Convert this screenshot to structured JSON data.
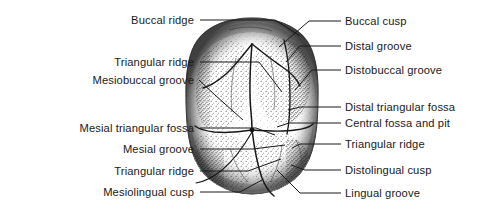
{
  "figure": {
    "kind": "anatomical-line-drawing",
    "view": "occlusal",
    "background_color": "#ffffff",
    "ink_color": "#1a1a1a"
  },
  "labels_left": [
    {
      "text": "Buccal ridge",
      "label_x": 194,
      "label_y": 24,
      "leader": "M200,20 L275,20 L300,36"
    },
    {
      "text": "Triangular ridge",
      "label_x": 194,
      "label_y": 66,
      "leader": "M200,62 L259,62 L282,92"
    },
    {
      "text": "Mesiobuccal groove",
      "label_x": 194,
      "label_y": 84,
      "leader": "M199,80 L215,95 L243,120"
    },
    {
      "text": "Mesial triangular fossa",
      "label_x": 194,
      "label_y": 132,
      "leader": "M200,128 L256,128 L275,135"
    },
    {
      "text": "Mesial groove",
      "label_x": 194,
      "label_y": 153,
      "leader": "M200,149 L253,149 L285,145"
    },
    {
      "text": "Triangular ridge",
      "label_x": 194,
      "label_y": 175,
      "leader": "M200,171 L248,171 L281,159"
    },
    {
      "text": "Mesiolingual cusp",
      "label_x": 194,
      "label_y": 196,
      "leader": "M200,192 L240,192 L262,180"
    }
  ],
  "labels_right": [
    {
      "text": "Buccal cusp",
      "label_x": 345,
      "label_y": 25,
      "leader": "M341,21 L309,21 L279,47"
    },
    {
      "text": "Distal groove",
      "label_x": 345,
      "label_y": 50,
      "leader": "M341,46 L300,46 L286,62"
    },
    {
      "text": "Distobuccal groove",
      "label_x": 345,
      "label_y": 74,
      "leader": "M341,70 L312,70 L295,90"
    },
    {
      "text": "Distal triangular fossa",
      "label_x": 345,
      "label_y": 111,
      "leader": "M341,107 L300,107 L288,110"
    },
    {
      "text": "Central fossa and pit",
      "label_x": 345,
      "label_y": 127,
      "leader": "M341,123 L289,123 L277,127"
    },
    {
      "text": "Triangular ridge",
      "label_x": 345,
      "label_y": 148,
      "leader": "M341,144 L300,144 L292,148"
    },
    {
      "text": "Distolingual cusp",
      "label_x": 345,
      "label_y": 174,
      "leader": "M341,170 L305,170 L291,165"
    },
    {
      "text": "Lingual groove",
      "label_x": 345,
      "label_y": 197,
      "leader": "M341,193 L300,193 L277,170"
    }
  ]
}
